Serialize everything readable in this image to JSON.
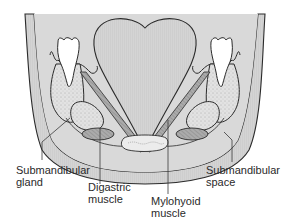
{
  "diagram": {
    "colors": {
      "tissue_fill": "#d6d6d6",
      "tongue_fill": "#cfcfcf",
      "muscle_fill": "#a9a9a9",
      "gland_fill": "#e4e4e4",
      "outline": "#2b2b2b",
      "background": "#ffffff",
      "tooth_fill": "#ffffff"
    },
    "structures": [
      "tongue",
      "left molar",
      "right molar",
      "mandible left",
      "mandible right",
      "mylohyoid muscle left",
      "mylohyoid muscle right",
      "submandibular gland left",
      "submandibular gland right",
      "digastric muscle left",
      "digastric muscle right",
      "hyoid region",
      "skin/subcutaneous layer"
    ]
  },
  "labels": {
    "submandibular_gland": {
      "line1": "Submandibular",
      "line2": "gland"
    },
    "digastric_muscle": {
      "line1": "Digastric",
      "line2": "muscle"
    },
    "mylohyoid_muscle": {
      "line1": "Mylohyoid",
      "line2": "muscle"
    },
    "submandibular_space": {
      "line1": "Submandibular",
      "line2": "space"
    }
  }
}
